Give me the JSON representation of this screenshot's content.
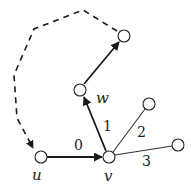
{
  "diagram": {
    "type": "graph",
    "vertices": [
      {
        "id": "u",
        "label": "u",
        "x": 41,
        "y": 157,
        "label_x": 35,
        "label_y": 181
      },
      {
        "id": "v",
        "label": "v",
        "x": 109,
        "y": 157,
        "label_x": 104,
        "label_y": 182
      },
      {
        "id": "w",
        "label": "w",
        "x": 80,
        "y": 90,
        "label_x": 97,
        "label_y": 103
      },
      {
        "id": "top",
        "label": "",
        "x": 124,
        "y": 36
      },
      {
        "id": "n2",
        "label": "",
        "x": 149,
        "y": 104
      },
      {
        "id": "n3",
        "label": "",
        "x": 178,
        "y": 145
      }
    ],
    "edges": [
      {
        "from": "u",
        "to": "v",
        "label": "0",
        "style": "thick",
        "directed": true
      },
      {
        "from": "v",
        "to": "w",
        "label": "1",
        "style": "thick",
        "directed": true
      },
      {
        "from": "v",
        "to": "n2",
        "label": "2",
        "style": "thin",
        "directed": false
      },
      {
        "from": "v",
        "to": "n3",
        "label": "3",
        "style": "thin",
        "directed": false
      },
      {
        "from": "w",
        "to": "top",
        "label": "",
        "style": "thick",
        "directed": true
      },
      {
        "from": "top",
        "to": "u",
        "label": "",
        "style": "dashed",
        "directed": true
      }
    ],
    "edge_labels": {
      "e0": "0",
      "e1": "1",
      "e2": "2",
      "e3": "3"
    },
    "vertex_labels": {
      "u": "u",
      "v": "v",
      "w": "w"
    }
  }
}
